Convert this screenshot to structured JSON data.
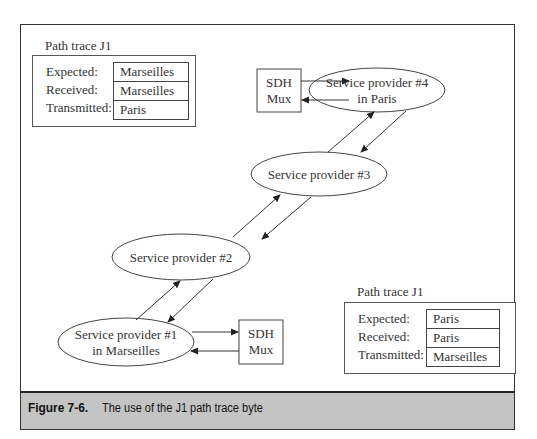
{
  "figure": {
    "label": "Figure 7-6.",
    "caption": "The use of the J1 path trace byte"
  },
  "trace_left": {
    "title": "Path trace J1",
    "rows": [
      {
        "label": "Expected:",
        "value": "Marseilles"
      },
      {
        "label": "Received:",
        "value": "Marseilles"
      },
      {
        "label": "Transmitted:",
        "value": "Paris"
      }
    ]
  },
  "trace_right": {
    "title": "Path trace J1",
    "rows": [
      {
        "label": "Expected:",
        "value": "Paris"
      },
      {
        "label": "Received:",
        "value": "Paris"
      },
      {
        "label": "Transmitted:",
        "value": "Marseilles"
      }
    ]
  },
  "nodes": {
    "sp4": {
      "line1": "Service provider #4",
      "line2": "in Paris"
    },
    "sp3": {
      "line1": "Service provider #3"
    },
    "sp2": {
      "line1": "Service provider #2"
    },
    "sp1": {
      "line1": "Service provider #1",
      "line2": "in Marseilles"
    },
    "mux_top": {
      "line1": "SDH",
      "line2": "Mux"
    },
    "mux_bottom": {
      "line1": "SDH",
      "line2": "Mux"
    }
  }
}
